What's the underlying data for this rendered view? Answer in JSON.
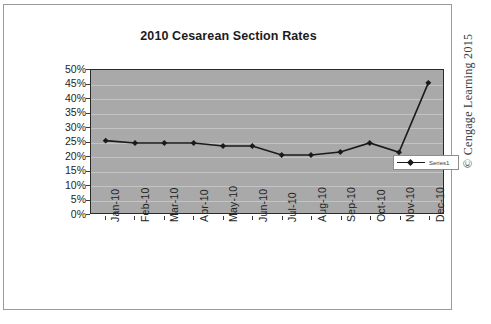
{
  "chart_data": {
    "type": "line",
    "title": "2010 Cesarean Section Rates",
    "xlabel": "",
    "ylabel": "",
    "categories": [
      "Jan-10",
      "Feb-10",
      "Mar-10",
      "Apr-10",
      "May-10",
      "Jun-10",
      "Jul-10",
      "Aug-10",
      "Sep-10",
      "Oct-10",
      "Nov-10",
      "Dec-10"
    ],
    "series": [
      {
        "name": "Series1",
        "values": [
          25.3,
          24.5,
          24.5,
          24.5,
          23.4,
          23.4,
          20.3,
          20.3,
          21.3,
          24.5,
          21.2,
          45.5
        ]
      }
    ],
    "ylim": [
      0,
      50
    ],
    "ytick_labels": [
      "50%",
      "45%",
      "40%",
      "35%",
      "30%",
      "25%",
      "20%",
      "15%",
      "10%",
      "5%",
      "0%"
    ],
    "ytick_values": [
      50,
      45,
      40,
      35,
      30,
      25,
      20,
      15,
      10,
      5,
      0
    ],
    "grid": true,
    "legend_position": "right",
    "plot_background_color": "#a9a9a9",
    "gridline_color": "#c4c4c4",
    "series_color": "#1a1a1a",
    "marker": "diamond"
  },
  "legend": {
    "entries": [
      {
        "label": "Series1"
      }
    ]
  },
  "footer": {
    "copyright": "© Cengage Learning 2015"
  }
}
